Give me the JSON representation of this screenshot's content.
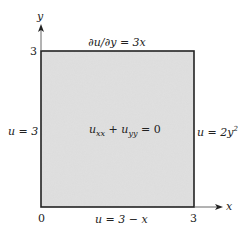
{
  "diagram": {
    "type": "boundary-value-problem",
    "region": {
      "x_range": [
        0,
        3
      ],
      "y_range": [
        0,
        3
      ],
      "fill_color": "#dcdcdc",
      "edge_color": "#222222"
    },
    "axes": {
      "x": {
        "label": "x",
        "tick_labels": [
          "0",
          "3"
        ]
      },
      "y": {
        "label": "y",
        "tick_labels": [
          "3"
        ]
      }
    },
    "equation": {
      "u": "u",
      "xx": "xx",
      "plus": " + ",
      "yy": "yy",
      "rhs": " = 0"
    },
    "boundary_conditions": {
      "top": {
        "text": "∂u/∂y = 3x"
      },
      "left": {
        "text": "u = 3"
      },
      "right": {
        "base": "u = 2y",
        "exp": "2"
      },
      "bottom": {
        "text": "u = 3 − x"
      }
    }
  }
}
